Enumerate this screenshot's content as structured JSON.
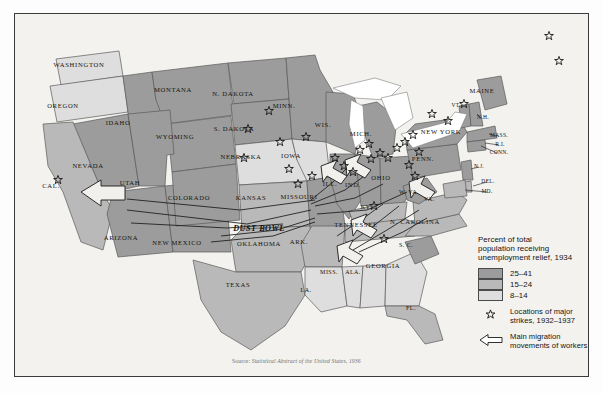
{
  "map": {
    "title": "Percent of total population receiving unemployment relief, 1934",
    "source": "Source: Statistical Abstract of the United States, 1936",
    "source_prefix": "Source: ",
    "source_body": "Statistical Abstract of the United States, 1936",
    "dust_bowl_label": "DUST BOWL",
    "colors": {
      "tier_high": "#9c9c9c",
      "tier_mid": "#b9b9b9",
      "tier_low": "#dedede",
      "water": "#ffffff",
      "background": "#f3f2ef",
      "outline": "#4a4a4a",
      "border": "#3a3a3a"
    }
  },
  "legend": {
    "title_lines": [
      "Percent of total",
      "population receiving",
      "unemployment relief, 1934"
    ],
    "classes": [
      {
        "label": "25–41",
        "color": "#9c9c9c"
      },
      {
        "label": "15–24",
        "color": "#b9b9b9"
      },
      {
        "label": "8–14",
        "color": "#dedede"
      }
    ],
    "keys": [
      {
        "icon": "strike-star-icon",
        "lines": [
          "Locations of major",
          "strikes, 1932–1937"
        ]
      },
      {
        "icon": "migration-arrow-icon",
        "lines": [
          "Main migration",
          "movements of workers"
        ]
      }
    ]
  },
  "states": [
    {
      "name": "WASHINGTON",
      "tier": "low",
      "x": 78,
      "y": 64,
      "size": "md"
    },
    {
      "name": "OREGON",
      "tier": "low",
      "x": 62,
      "y": 105,
      "size": "md"
    },
    {
      "name": "IDAHO",
      "tier": "high",
      "x": 117,
      "y": 122,
      "size": "md"
    },
    {
      "name": "MONTANA",
      "tier": "high",
      "x": 172,
      "y": 89,
      "size": "md"
    },
    {
      "name": "WYOMING",
      "tier": "high",
      "x": 174,
      "y": 136,
      "size": "md"
    },
    {
      "name": "NEVADA",
      "tier": "high",
      "x": 87,
      "y": 165,
      "size": "md"
    },
    {
      "name": "CAL.",
      "tier": "mid",
      "x": 50,
      "y": 185,
      "size": "md"
    },
    {
      "name": "UTAH",
      "tier": "high",
      "x": 129,
      "y": 182,
      "size": "md"
    },
    {
      "name": "ARIZONA",
      "tier": "high",
      "x": 120,
      "y": 237,
      "size": "md"
    },
    {
      "name": "NEW MEXICO",
      "tier": "high",
      "x": 176,
      "y": 242,
      "size": "md"
    },
    {
      "name": "COLORADO",
      "tier": "high",
      "x": 188,
      "y": 197,
      "size": "md"
    },
    {
      "name": "N. DAKOTA",
      "tier": "high",
      "x": 232,
      "y": 93,
      "size": "md"
    },
    {
      "name": "S. DAKOTA",
      "tier": "high",
      "x": 233,
      "y": 128,
      "size": "md"
    },
    {
      "name": "NEBRASKA",
      "tier": "low",
      "x": 240,
      "y": 156,
      "size": "md"
    },
    {
      "name": "KANSAS",
      "tier": "mid",
      "x": 250,
      "y": 197,
      "size": "md"
    },
    {
      "name": "OKLAHOMA",
      "tier": "mid",
      "x": 258,
      "y": 243,
      "size": "md"
    },
    {
      "name": "TEXAS",
      "tier": "mid",
      "x": 237,
      "y": 284,
      "size": "md"
    },
    {
      "name": "MINN.",
      "tier": "high",
      "x": 283,
      "y": 105,
      "size": "md"
    },
    {
      "name": "IOWA",
      "tier": "low",
      "x": 290,
      "y": 155,
      "size": "md"
    },
    {
      "name": "MISSOURI",
      "tier": "high",
      "x": 298,
      "y": 196,
      "size": "md"
    },
    {
      "name": "ARK.",
      "tier": "mid",
      "x": 298,
      "y": 241,
      "size": "md"
    },
    {
      "name": "LA.",
      "tier": "low",
      "x": 305,
      "y": 290,
      "size": "sm"
    },
    {
      "name": "MISS.",
      "tier": "low",
      "x": 328,
      "y": 272,
      "size": "sm"
    },
    {
      "name": "ALA.",
      "tier": "low",
      "x": 352,
      "y": 272,
      "size": "sm"
    },
    {
      "name": "WIS.",
      "tier": "high",
      "x": 322,
      "y": 124,
      "size": "md"
    },
    {
      "name": "ILL.",
      "tier": "high",
      "x": 329,
      "y": 183,
      "size": "md"
    },
    {
      "name": "IND.",
      "tier": "high",
      "x": 352,
      "y": 184,
      "size": "md"
    },
    {
      "name": "MICH.",
      "tier": "high",
      "x": 360,
      "y": 133,
      "size": "md"
    },
    {
      "name": "OHIO",
      "tier": "high",
      "x": 380,
      "y": 177,
      "size": "md"
    },
    {
      "name": "KY.",
      "tier": "mid",
      "x": 365,
      "y": 207,
      "size": "sm"
    },
    {
      "name": "TENNESSEE",
      "tier": "mid",
      "x": 355,
      "y": 224,
      "size": "md"
    },
    {
      "name": "GEORGIA",
      "tier": "low",
      "x": 382,
      "y": 265,
      "size": "md"
    },
    {
      "name": "FL.",
      "tier": "mid",
      "x": 410,
      "y": 308,
      "size": "sm"
    },
    {
      "name": "S. C.",
      "tier": "high",
      "x": 405,
      "y": 245,
      "size": "sm"
    },
    {
      "name": "N. CAROLINA",
      "tier": "mid",
      "x": 414,
      "y": 221,
      "size": "md"
    },
    {
      "name": "VA.",
      "tier": "mid",
      "x": 428,
      "y": 199,
      "size": "sm"
    },
    {
      "name": "W. VA.",
      "tier": "high",
      "x": 408,
      "y": 192,
      "size": "sm"
    },
    {
      "name": "PENN.",
      "tier": "high",
      "x": 422,
      "y": 158,
      "size": "md"
    },
    {
      "name": "NEW YORK",
      "tier": "high",
      "x": 440,
      "y": 131,
      "size": "md"
    },
    {
      "name": "MAINE",
      "tier": "high",
      "x": 481,
      "y": 90,
      "size": "md"
    },
    {
      "name": "VT.",
      "tier": "high",
      "x": 455,
      "y": 105,
      "size": "xs"
    },
    {
      "name": "N.H.",
      "tier": "high",
      "x": 482,
      "y": 117,
      "size": "xs"
    },
    {
      "name": "MASS.",
      "tier": "high",
      "x": 498,
      "y": 135,
      "size": "xs"
    },
    {
      "name": "R.I.",
      "tier": "high",
      "x": 499,
      "y": 144,
      "size": "xs"
    },
    {
      "name": "CONN.",
      "tier": "high",
      "x": 498,
      "y": 152,
      "size": "xs"
    },
    {
      "name": "N.J.",
      "tier": "high",
      "x": 478,
      "y": 166,
      "size": "xs"
    },
    {
      "name": "DEL.",
      "tier": "mid",
      "x": 487,
      "y": 181,
      "size": "xs"
    },
    {
      "name": "MD.",
      "tier": "mid",
      "x": 486,
      "y": 191,
      "size": "xs"
    }
  ],
  "strikes": [
    {
      "x": 57,
      "y": 179
    },
    {
      "x": 268,
      "y": 110
    },
    {
      "x": 247,
      "y": 128
    },
    {
      "x": 305,
      "y": 136
    },
    {
      "x": 243,
      "y": 157
    },
    {
      "x": 279,
      "y": 141
    },
    {
      "x": 288,
      "y": 168
    },
    {
      "x": 334,
      "y": 157
    },
    {
      "x": 343,
      "y": 165
    },
    {
      "x": 352,
      "y": 171
    },
    {
      "x": 359,
      "y": 149
    },
    {
      "x": 368,
      "y": 143
    },
    {
      "x": 370,
      "y": 158
    },
    {
      "x": 379,
      "y": 152
    },
    {
      "x": 387,
      "y": 157
    },
    {
      "x": 396,
      "y": 147
    },
    {
      "x": 404,
      "y": 141
    },
    {
      "x": 412,
      "y": 134
    },
    {
      "x": 418,
      "y": 151
    },
    {
      "x": 408,
      "y": 164
    },
    {
      "x": 414,
      "y": 175
    },
    {
      "x": 311,
      "y": 175
    },
    {
      "x": 297,
      "y": 183
    },
    {
      "x": 373,
      "y": 205
    },
    {
      "x": 383,
      "y": 238
    },
    {
      "x": 431,
      "y": 113
    },
    {
      "x": 447,
      "y": 120
    },
    {
      "x": 463,
      "y": 103
    },
    {
      "x": 558,
      "y": 60
    },
    {
      "x": 548,
      "y": 35
    }
  ],
  "annotations": {
    "dust_bowl": {
      "label": "DUST BOWL",
      "x": 258,
      "y": 228
    }
  }
}
